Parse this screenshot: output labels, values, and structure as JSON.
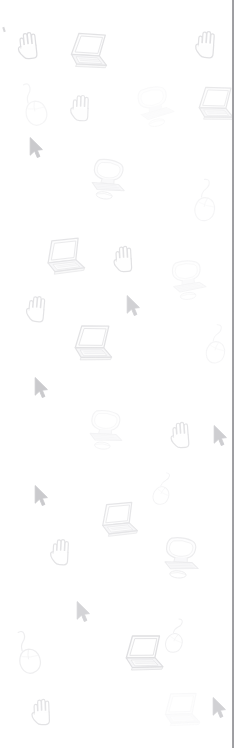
{
  "page": {
    "background_color": "#ffffff",
    "width": 247,
    "height": 748
  },
  "divider": {
    "name": "vertical-divider-line",
    "x": 232,
    "width": 2,
    "color": "#8e8e92"
  },
  "speck": {
    "name": "left-edge-speck",
    "x": 3,
    "y": 27,
    "color": "#d8d8da"
  },
  "palette": {
    "ink_dark": "#9a9a9e",
    "ink_mid": "#c4c4c8",
    "ink_light": "#e2e2e6",
    "ink_faint": "#f0f0f3",
    "screen_fill": "#fbfbfc",
    "body_fill": "#ececf0"
  },
  "icons": [
    {
      "name": "hand-cursor-icon",
      "type": "hand",
      "x": 13,
      "y": 27,
      "w": 32,
      "h": 34,
      "rot": -6,
      "opacity": 0.42,
      "tone": "#b3b3b8"
    },
    {
      "name": "laptop-icon",
      "type": "laptop",
      "x": 62,
      "y": 30,
      "w": 50,
      "h": 44,
      "rot": 7,
      "opacity": 0.4,
      "tone": "#b9b9be"
    },
    {
      "name": "hand-cursor-icon",
      "type": "hand",
      "x": 191,
      "y": 26,
      "w": 32,
      "h": 34,
      "rot": 4,
      "opacity": 0.4,
      "tone": "#b5b5ba"
    },
    {
      "name": "computer-mouse-icon",
      "type": "mouse",
      "x": 18,
      "y": 80,
      "w": 36,
      "h": 48,
      "rot": -10,
      "opacity": 0.22,
      "tone": "#d0d0d5"
    },
    {
      "name": "hand-cursor-icon",
      "type": "hand",
      "x": 66,
      "y": 90,
      "w": 31,
      "h": 33,
      "rot": 2,
      "opacity": 0.36,
      "tone": "#bcbcc1"
    },
    {
      "name": "desktop-computer-icon",
      "type": "desktop",
      "x": 131,
      "y": 84,
      "w": 48,
      "h": 45,
      "rot": -12,
      "opacity": 0.16,
      "tone": "#dedee2"
    },
    {
      "name": "laptop-icon",
      "type": "laptop",
      "x": 190,
      "y": 84,
      "w": 48,
      "h": 42,
      "rot": 5,
      "opacity": 0.35,
      "tone": "#bebec3"
    },
    {
      "name": "arrow-cursor-icon",
      "type": "arrow",
      "x": 28,
      "y": 136,
      "w": 16,
      "h": 24,
      "rot": 0,
      "opacity": 0.55,
      "tone": "#a0a0a6"
    },
    {
      "name": "desktop-computer-icon",
      "type": "desktop",
      "x": 84,
      "y": 157,
      "w": 48,
      "h": 45,
      "rot": 8,
      "opacity": 0.3,
      "tone": "#cbcbd0"
    },
    {
      "name": "computer-mouse-icon",
      "type": "mouse",
      "x": 190,
      "y": 178,
      "w": 36,
      "h": 46,
      "rot": 14,
      "opacity": 0.22,
      "tone": "#d2d2d7"
    },
    {
      "name": "laptop-icon",
      "type": "laptop",
      "x": 38,
      "y": 236,
      "w": 50,
      "h": 44,
      "rot": -3,
      "opacity": 0.38,
      "tone": "#bbbbc0"
    },
    {
      "name": "hand-cursor-icon",
      "type": "hand",
      "x": 109,
      "y": 241,
      "w": 31,
      "h": 33,
      "rot": -3,
      "opacity": 0.4,
      "tone": "#b6b6bb"
    },
    {
      "name": "desktop-computer-icon",
      "type": "desktop",
      "x": 165,
      "y": 258,
      "w": 46,
      "h": 44,
      "rot": -6,
      "opacity": 0.22,
      "tone": "#d4d4d9"
    },
    {
      "name": "hand-cursor-icon",
      "type": "hand",
      "x": 22,
      "y": 291,
      "w": 31,
      "h": 33,
      "rot": 5,
      "opacity": 0.38,
      "tone": "#b8b8bd"
    },
    {
      "name": "arrow-cursor-icon",
      "type": "arrow",
      "x": 125,
      "y": 294,
      "w": 16,
      "h": 24,
      "rot": 0,
      "opacity": 0.5,
      "tone": "#a5a5ab"
    },
    {
      "name": "computer-mouse-icon",
      "type": "mouse",
      "x": 203,
      "y": 322,
      "w": 32,
      "h": 46,
      "rot": 18,
      "opacity": 0.22,
      "tone": "#d2d2d7"
    },
    {
      "name": "laptop-icon",
      "type": "laptop",
      "x": 66,
      "y": 322,
      "w": 50,
      "h": 45,
      "rot": 4,
      "opacity": 0.4,
      "tone": "#b9b9be"
    },
    {
      "name": "arrow-cursor-icon",
      "type": "arrow",
      "x": 33,
      "y": 376,
      "w": 16,
      "h": 24,
      "rot": 0,
      "opacity": 0.55,
      "tone": "#a0a0a6"
    },
    {
      "name": "desktop-computer-icon",
      "type": "desktop",
      "x": 82,
      "y": 408,
      "w": 47,
      "h": 44,
      "rot": 6,
      "opacity": 0.24,
      "tone": "#d1d1d6"
    },
    {
      "name": "hand-cursor-icon",
      "type": "hand",
      "x": 166,
      "y": 417,
      "w": 31,
      "h": 33,
      "rot": -4,
      "opacity": 0.38,
      "tone": "#b7b7bc"
    },
    {
      "name": "arrow-cursor-icon",
      "type": "arrow",
      "x": 212,
      "y": 424,
      "w": 16,
      "h": 24,
      "rot": 0,
      "opacity": 0.52,
      "tone": "#a2a2a8"
    },
    {
      "name": "arrow-cursor-icon",
      "type": "arrow",
      "x": 33,
      "y": 484,
      "w": 16,
      "h": 24,
      "rot": 0,
      "opacity": 0.55,
      "tone": "#a0a0a6"
    },
    {
      "name": "computer-mouse-icon",
      "type": "mouse",
      "x": 145,
      "y": 472,
      "w": 40,
      "h": 36,
      "rot": 28,
      "opacity": 0.25,
      "tone": "#cfcfd4"
    },
    {
      "name": "laptop-icon",
      "type": "laptop",
      "x": 93,
      "y": 500,
      "w": 48,
      "h": 42,
      "rot": -2,
      "opacity": 0.38,
      "tone": "#bcbcc1"
    },
    {
      "name": "hand-cursor-icon",
      "type": "hand",
      "x": 46,
      "y": 534,
      "w": 31,
      "h": 33,
      "rot": 3,
      "opacity": 0.38,
      "tone": "#b7b7bc"
    },
    {
      "name": "desktop-computer-icon",
      "type": "desktop",
      "x": 157,
      "y": 534,
      "w": 48,
      "h": 48,
      "rot": 5,
      "opacity": 0.32,
      "tone": "#c6c6cb"
    },
    {
      "name": "arrow-cursor-icon",
      "type": "arrow",
      "x": 75,
      "y": 600,
      "w": 16,
      "h": 24,
      "rot": 0,
      "opacity": 0.48,
      "tone": "#a6a6ac"
    },
    {
      "name": "computer-mouse-icon",
      "type": "mouse",
      "x": 12,
      "y": 628,
      "w": 36,
      "h": 48,
      "rot": -8,
      "opacity": 0.3,
      "tone": "#c8c8cd"
    },
    {
      "name": "computer-mouse-icon",
      "type": "mouse",
      "x": 157,
      "y": 618,
      "w": 42,
      "h": 38,
      "rot": 26,
      "opacity": 0.28,
      "tone": "#cacacf"
    },
    {
      "name": "laptop-icon",
      "type": "laptop",
      "x": 117,
      "y": 632,
      "w": 50,
      "h": 45,
      "rot": 3,
      "opacity": 0.42,
      "tone": "#b4b4b9"
    },
    {
      "name": "hand-cursor-icon",
      "type": "hand",
      "x": 27,
      "y": 694,
      "w": 31,
      "h": 33,
      "rot": -2,
      "opacity": 0.38,
      "tone": "#b7b7bc"
    },
    {
      "name": "laptop-icon",
      "type": "laptop",
      "x": 156,
      "y": 690,
      "w": 48,
      "h": 42,
      "rot": 2,
      "opacity": 0.17,
      "tone": "#dcdce1"
    },
    {
      "name": "arrow-cursor-icon",
      "type": "arrow",
      "x": 211,
      "y": 696,
      "w": 16,
      "h": 24,
      "rot": 0,
      "opacity": 0.5,
      "tone": "#a4a4aa"
    }
  ]
}
